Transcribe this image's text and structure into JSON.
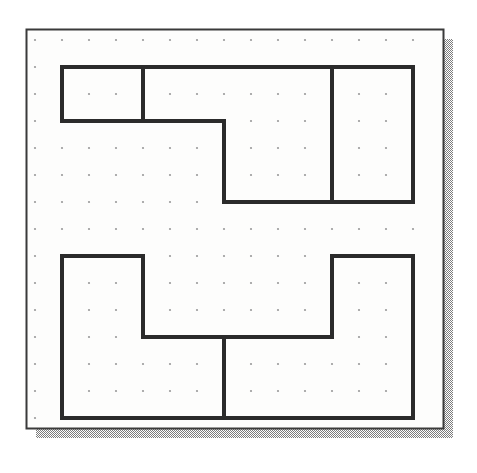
{
  "document": {
    "title": "Dot-grid geometry figure",
    "background_color": "#ffffff"
  },
  "canvas": {
    "width": 477,
    "height": 473
  },
  "paper": {
    "name": "dot-grid-sheet",
    "x": 26,
    "y": 29,
    "width": 417,
    "height": 399,
    "fill_color": "#fdfdfc",
    "border_color": "#3a3a3a",
    "border_width": 2
  },
  "shadow": {
    "name": "drop-shadow",
    "offset_x": 10,
    "offset_y": 10,
    "color": "#8d8d8d",
    "pattern": "dither-50"
  },
  "grid": {
    "origin_x": 35,
    "origin_y": 40,
    "spacing_x": 27,
    "spacing_y": 27,
    "columns": 15,
    "rows": 15,
    "dot_radius": 1.1,
    "dot_color": "#9a9a9a"
  },
  "stroke": {
    "color": "#2b2b2b",
    "width": 4,
    "linejoin": "miter",
    "linecap": "butt"
  },
  "chart_data": {
    "type": "diagram",
    "subtitle": "Two composite rectilinear polygons drawn on a square dot lattice",
    "grid": {
      "origin_px": [
        35,
        40
      ],
      "spacing_px": [
        27,
        27
      ],
      "columns": 15,
      "rows": 15
    },
    "shapes": [
      {
        "name": "upper-left-small-rectangle",
        "role": "sub-region",
        "closed": true,
        "points_grid": [
          [
            1,
            1
          ],
          [
            4,
            1
          ],
          [
            4,
            3
          ],
          [
            1,
            3
          ]
        ],
        "points_px": [
          [
            62,
            67
          ],
          [
            143,
            67
          ],
          [
            143,
            121
          ],
          [
            62,
            121
          ]
        ],
        "width_units": 3,
        "height_units": 2
      },
      {
        "name": "upper-l-shape",
        "role": "main-region",
        "closed": true,
        "points_grid": [
          [
            4,
            1
          ],
          [
            11,
            1
          ],
          [
            11,
            6
          ],
          [
            7,
            6
          ],
          [
            7,
            3
          ],
          [
            4,
            3
          ]
        ],
        "points_px": [
          [
            143,
            67
          ],
          [
            332,
            67
          ],
          [
            332,
            202
          ],
          [
            224,
            202
          ],
          [
            224,
            121
          ],
          [
            143,
            121
          ]
        ],
        "notes": "L-shaped polygon sharing its left edge with the small rectangle"
      },
      {
        "name": "upper-right-rectangle",
        "role": "sub-region",
        "closed": true,
        "points_grid": [
          [
            11,
            1
          ],
          [
            14,
            1
          ],
          [
            14,
            6
          ],
          [
            11,
            6
          ]
        ],
        "points_px": [
          [
            332,
            67
          ],
          [
            413,
            67
          ],
          [
            413,
            202
          ],
          [
            332,
            202
          ]
        ],
        "width_units": 3,
        "height_units": 5
      },
      {
        "name": "lower-left-l-shape",
        "role": "main-region",
        "closed": true,
        "points_grid": [
          [
            1,
            8
          ],
          [
            4,
            8
          ],
          [
            4,
            11
          ],
          [
            7,
            11
          ],
          [
            7,
            14
          ],
          [
            1,
            14
          ]
        ],
        "points_px": [
          [
            62,
            256
          ],
          [
            143,
            256
          ],
          [
            143,
            337
          ],
          [
            224,
            337
          ],
          [
            224,
            418
          ],
          [
            62,
            418
          ]
        ],
        "notes": "Stepped L polygon in the lower-left"
      },
      {
        "name": "lower-right-l-shape",
        "role": "main-region",
        "closed": true,
        "points_grid": [
          [
            11,
            8
          ],
          [
            14,
            8
          ],
          [
            14,
            14
          ],
          [
            7,
            14
          ],
          [
            7,
            11
          ],
          [
            11,
            11
          ]
        ],
        "points_px": [
          [
            332,
            256
          ],
          [
            413,
            256
          ],
          [
            413,
            418
          ],
          [
            224,
            418
          ],
          [
            224,
            337
          ],
          [
            332,
            337
          ]
        ],
        "notes": "Mirrored stepped L polygon in the lower-right, shares the short vertical divider at x=224"
      }
    ],
    "segments_px": [
      {
        "name": "upper-top-edge",
        "x1": 62,
        "y1": 67,
        "x2": 413,
        "y2": 67
      },
      {
        "name": "upper-left-edge",
        "x1": 62,
        "y1": 67,
        "x2": 62,
        "y2": 121
      },
      {
        "name": "upper-small-rect-bottom",
        "x1": 62,
        "y1": 121,
        "x2": 224,
        "y2": 121
      },
      {
        "name": "upper-small-rect-divider",
        "x1": 143,
        "y1": 67,
        "x2": 143,
        "y2": 121
      },
      {
        "name": "upper-inner-step-vertical",
        "x1": 224,
        "y1": 121,
        "x2": 224,
        "y2": 202
      },
      {
        "name": "upper-bottom-edge",
        "x1": 224,
        "y1": 202,
        "x2": 413,
        "y2": 202
      },
      {
        "name": "upper-right-divider",
        "x1": 332,
        "y1": 67,
        "x2": 332,
        "y2": 202
      },
      {
        "name": "upper-right-edge",
        "x1": 413,
        "y1": 67,
        "x2": 413,
        "y2": 202
      },
      {
        "name": "lower-left-top-edge",
        "x1": 62,
        "y1": 256,
        "x2": 143,
        "y2": 256
      },
      {
        "name": "lower-left-edge",
        "x1": 62,
        "y1": 256,
        "x2": 62,
        "y2": 418
      },
      {
        "name": "lower-left-step-vertical",
        "x1": 143,
        "y1": 256,
        "x2": 143,
        "y2": 337
      },
      {
        "name": "lower-middle-horizontal",
        "x1": 143,
        "y1": 337,
        "x2": 332,
        "y2": 337
      },
      {
        "name": "lower-center-divider",
        "x1": 224,
        "y1": 337,
        "x2": 224,
        "y2": 418
      },
      {
        "name": "lower-right-step-vertical",
        "x1": 332,
        "y1": 256,
        "x2": 332,
        "y2": 337
      },
      {
        "name": "lower-right-top-edge",
        "x1": 332,
        "y1": 256,
        "x2": 413,
        "y2": 256
      },
      {
        "name": "lower-right-edge",
        "x1": 413,
        "y1": 256,
        "x2": 413,
        "y2": 418
      },
      {
        "name": "lower-bottom-edge",
        "x1": 62,
        "y1": 418,
        "x2": 413,
        "y2": 418
      }
    ]
  }
}
